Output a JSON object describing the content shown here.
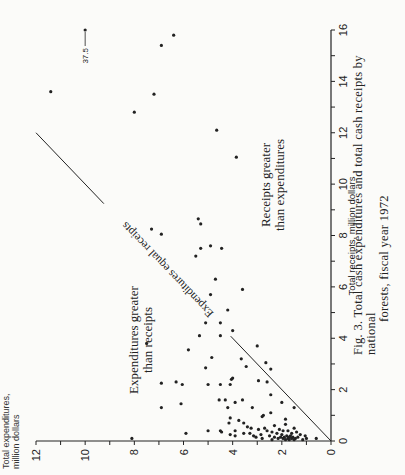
{
  "figure": {
    "caption_line1": "Fig. 3.  Total cash expenditures and total cash receipts by national",
    "caption_line2": "forests, fiscal year 1972",
    "ylabel_line1": "Total expenditures,",
    "ylabel_line2": "million dollars",
    "xlabel": "Total receipts, million dollars",
    "region_upper_line1": "Expenditures greater",
    "region_upper_line2": "than receipts",
    "region_lower_line1": "Receipts greater",
    "region_lower_line2": "than expenditures",
    "diagonal_label": "Expenditures equal receipts",
    "offscale_label": "37.5",
    "ink_color": "#222222",
    "background_color": "#fbfbf9"
  },
  "chart_data": {
    "type": "scatter",
    "title": "Fig. 3. Total cash expenditures and total cash receipts by national forests, fiscal year 1972",
    "xlabel": "Total receipts, million dollars",
    "ylabel": "Total expenditures, million dollars",
    "xlim": [
      0,
      16
    ],
    "ylim": [
      0,
      12
    ],
    "xticks": [
      0,
      2,
      4,
      6,
      8,
      10,
      12,
      14,
      16
    ],
    "yticks": [
      0,
      2,
      4,
      6,
      8,
      10,
      12
    ],
    "minor_ticks": true,
    "grid": false,
    "legend": null,
    "orientation_note": "figure printed rotated 90 degrees counter-clockwise",
    "reference_line": {
      "label": "Expenditures equal receipts",
      "from": [
        0,
        0
      ],
      "to": [
        12,
        12
      ]
    },
    "annotations": [
      {
        "text": "Expenditures greater than receipts",
        "region": "above diagonal"
      },
      {
        "text": "Receipts greater than expenditures",
        "region": "below diagonal"
      },
      {
        "text": "37.5",
        "note": "off-scale receipts value plotted at x=16, y=10"
      }
    ],
    "points": [
      {
        "x": 16.0,
        "y": 10.0,
        "offscale_x": 37.5
      },
      {
        "x": 15.8,
        "y": 6.4
      },
      {
        "x": 15.4,
        "y": 6.9
      },
      {
        "x": 13.6,
        "y": 11.4
      },
      {
        "x": 13.5,
        "y": 7.2
      },
      {
        "x": 12.8,
        "y": 8.0
      },
      {
        "x": 12.1,
        "y": 4.65
      },
      {
        "x": 11.05,
        "y": 3.85
      },
      {
        "x": 8.65,
        "y": 5.4
      },
      {
        "x": 8.45,
        "y": 5.3
      },
      {
        "x": 8.25,
        "y": 7.3
      },
      {
        "x": 8.05,
        "y": 6.9
      },
      {
        "x": 7.6,
        "y": 4.9
      },
      {
        "x": 7.5,
        "y": 5.3
      },
      {
        "x": 7.5,
        "y": 4.45
      },
      {
        "x": 7.2,
        "y": 5.5
      },
      {
        "x": 6.3,
        "y": 4.7
      },
      {
        "x": 5.9,
        "y": 3.6
      },
      {
        "x": 5.7,
        "y": 4.9
      },
      {
        "x": 5.1,
        "y": 4.2
      },
      {
        "x": 4.6,
        "y": 5.1
      },
      {
        "x": 4.6,
        "y": 4.5
      },
      {
        "x": 4.3,
        "y": 4.0
      },
      {
        "x": 4.1,
        "y": 5.35
      },
      {
        "x": 4.1,
        "y": 4.5
      },
      {
        "x": 3.8,
        "y": 7.5
      },
      {
        "x": 3.7,
        "y": 3.0
      },
      {
        "x": 3.55,
        "y": 5.8
      },
      {
        "x": 3.25,
        "y": 4.85
      },
      {
        "x": 3.2,
        "y": 3.65
      },
      {
        "x": 3.05,
        "y": 2.65
      },
      {
        "x": 2.9,
        "y": 3.45
      },
      {
        "x": 2.85,
        "y": 5.1
      },
      {
        "x": 2.8,
        "y": 2.45
      },
      {
        "x": 2.45,
        "y": 4.0
      },
      {
        "x": 2.4,
        "y": 4.05
      },
      {
        "x": 2.35,
        "y": 2.95
      },
      {
        "x": 2.3,
        "y": 6.3
      },
      {
        "x": 2.3,
        "y": 2.6
      },
      {
        "x": 2.25,
        "y": 6.9
      },
      {
        "x": 2.2,
        "y": 6.05
      },
      {
        "x": 2.2,
        "y": 5.0
      },
      {
        "x": 2.2,
        "y": 4.5
      },
      {
        "x": 2.2,
        "y": 4.1
      },
      {
        "x": 1.8,
        "y": 2.45
      },
      {
        "x": 1.6,
        "y": 4.55
      },
      {
        "x": 1.6,
        "y": 4.3
      },
      {
        "x": 1.6,
        "y": 3.6
      },
      {
        "x": 1.5,
        "y": 3.9
      },
      {
        "x": 1.5,
        "y": 2.0
      },
      {
        "x": 1.45,
        "y": 6.1
      },
      {
        "x": 1.3,
        "y": 6.9
      },
      {
        "x": 1.3,
        "y": 4.2
      },
      {
        "x": 1.3,
        "y": 3.2
      },
      {
        "x": 1.3,
        "y": 1.5
      },
      {
        "x": 1.1,
        "y": 2.45
      },
      {
        "x": 1.0,
        "y": 2.75
      },
      {
        "x": 0.95,
        "y": 2.8
      },
      {
        "x": 0.9,
        "y": 4.1
      },
      {
        "x": 0.85,
        "y": 1.85
      },
      {
        "x": 0.8,
        "y": 3.75
      },
      {
        "x": 0.7,
        "y": 4.15
      },
      {
        "x": 0.7,
        "y": 3.55
      },
      {
        "x": 0.65,
        "y": 1.85
      },
      {
        "x": 0.6,
        "y": 2.3
      },
      {
        "x": 0.55,
        "y": 3.4
      },
      {
        "x": 0.5,
        "y": 3.25
      },
      {
        "x": 0.5,
        "y": 2.7
      },
      {
        "x": 0.5,
        "y": 1.5
      },
      {
        "x": 0.45,
        "y": 2.95
      },
      {
        "x": 0.45,
        "y": 2.1
      },
      {
        "x": 0.4,
        "y": 5.0
      },
      {
        "x": 0.4,
        "y": 4.5
      },
      {
        "x": 0.4,
        "y": 3.9
      },
      {
        "x": 0.4,
        "y": 2.6
      },
      {
        "x": 0.4,
        "y": 1.95
      },
      {
        "x": 0.4,
        "y": 1.75
      },
      {
        "x": 0.35,
        "y": 4.45
      },
      {
        "x": 0.35,
        "y": 2.4
      },
      {
        "x": 0.35,
        "y": 1.4
      },
      {
        "x": 0.3,
        "y": 5.9
      },
      {
        "x": 0.3,
        "y": 3.55
      },
      {
        "x": 0.3,
        "y": 3.3
      },
      {
        "x": 0.3,
        "y": 2.2
      },
      {
        "x": 0.3,
        "y": 1.6
      },
      {
        "x": 0.25,
        "y": 4.1
      },
      {
        "x": 0.25,
        "y": 2.85
      },
      {
        "x": 0.25,
        "y": 2.0
      },
      {
        "x": 0.25,
        "y": 1.25
      },
      {
        "x": 0.2,
        "y": 3.9
      },
      {
        "x": 0.2,
        "y": 3.15
      },
      {
        "x": 0.2,
        "y": 2.5
      },
      {
        "x": 0.2,
        "y": 1.8
      },
      {
        "x": 0.2,
        "y": 1.65
      },
      {
        "x": 0.2,
        "y": 1.05
      },
      {
        "x": 0.15,
        "y": 3.05
      },
      {
        "x": 0.15,
        "y": 2.3
      },
      {
        "x": 0.15,
        "y": 2.05
      },
      {
        "x": 0.15,
        "y": 1.9
      },
      {
        "x": 0.15,
        "y": 1.7
      },
      {
        "x": 0.15,
        "y": 1.55
      },
      {
        "x": 0.15,
        "y": 1.35
      },
      {
        "x": 0.1,
        "y": 8.1
      },
      {
        "x": 0.1,
        "y": 2.8
      },
      {
        "x": 0.1,
        "y": 2.15
      },
      {
        "x": 0.1,
        "y": 1.95
      },
      {
        "x": 0.1,
        "y": 1.75
      },
      {
        "x": 0.1,
        "y": 1.6
      },
      {
        "x": 0.1,
        "y": 1.45
      },
      {
        "x": 0.1,
        "y": 1.0
      },
      {
        "x": 0.1,
        "y": 0.6
      },
      {
        "x": 0.05,
        "y": 2.4
      },
      {
        "x": 0.05,
        "y": 1.85
      },
      {
        "x": 0.05,
        "y": 1.7
      },
      {
        "x": 0.05,
        "y": 1.5
      },
      {
        "x": 0.05,
        "y": 1.15
      }
    ]
  }
}
